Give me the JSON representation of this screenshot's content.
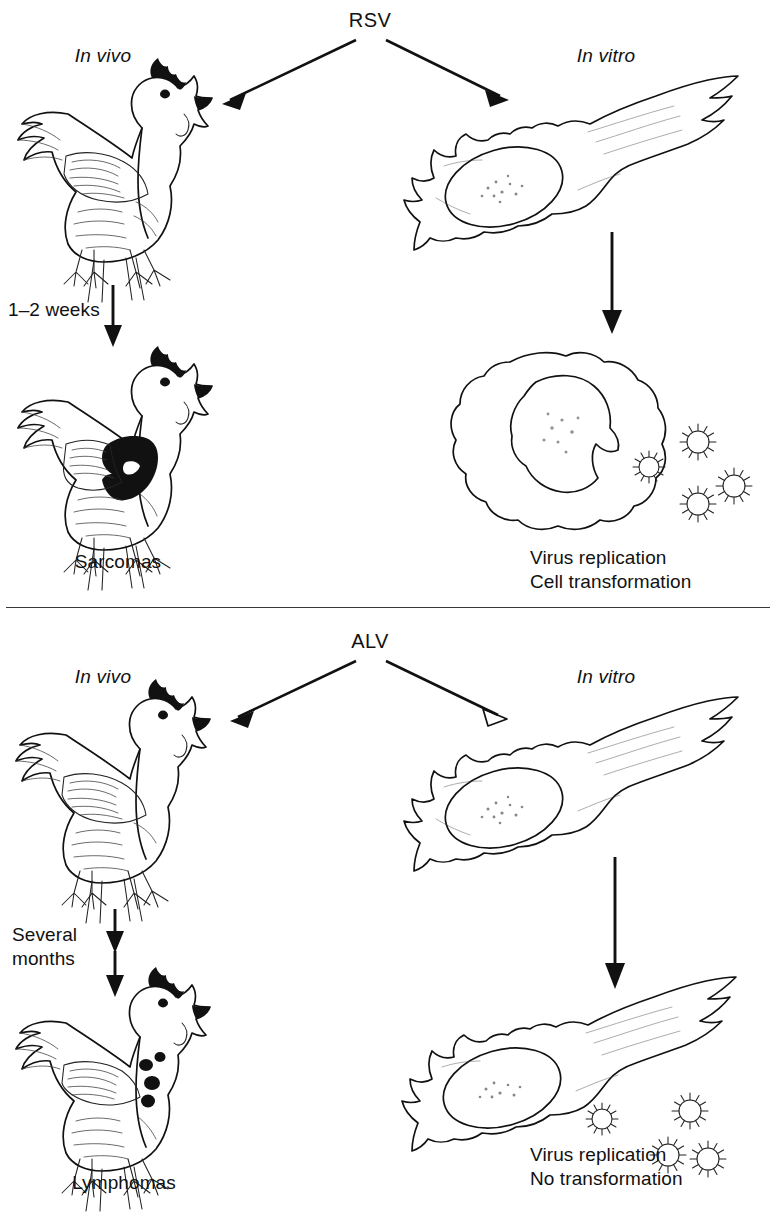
{
  "figure": {
    "divider": "horizontal-rule"
  },
  "panels": [
    {
      "id": "rsv",
      "virus_label": "RSV",
      "in_vivo_label": "In vivo",
      "in_vitro_label": "In vitro",
      "time_label": "1–2 weeks",
      "in_vivo_outcome": "Sarcomas",
      "in_vitro_outcome_line1": "Virus replication",
      "in_vitro_outcome_line2": "Cell transformation",
      "animal_top": "healthy-chicken",
      "animal_bottom": "chicken-with-sarcoma",
      "cell_top": "normal-fibroblast",
      "cell_bottom": "transformed-rounded-cell",
      "virion_count": 4
    },
    {
      "id": "alv",
      "virus_label": "ALV",
      "in_vivo_label": "In vivo",
      "in_vitro_label": "In vitro",
      "time_label_line1": "Several",
      "time_label_line2": "months",
      "in_vivo_outcome": "Lymphomas",
      "in_vitro_outcome_line1": "Virus replication",
      "in_vitro_outcome_line2": "No transformation",
      "animal_top": "healthy-chicken",
      "animal_bottom": "chicken-with-lymphoma-nodules",
      "cell_top": "normal-fibroblast",
      "cell_bottom": "normal-fibroblast-shedding-virus",
      "virion_count": 4
    }
  ],
  "colors": {
    "ink": "#111111",
    "background": "#ffffff",
    "divider": "#3a3a3a"
  }
}
